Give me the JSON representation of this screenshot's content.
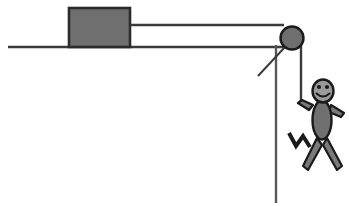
{
  "figure": {
    "canvas": {
      "width": 349,
      "height": 206,
      "background": "#ffffff"
    }
  },
  "colors": {
    "stroke_dark": "#1a1a1a",
    "fill_gray": "#6f6f6f",
    "body_gray": "#707070",
    "head_gray": "#9a9a9a",
    "limb_gray": "#7a7a7a",
    "surface_gray": "#3a3a3a",
    "background": "#ffffff"
  },
  "objects": {
    "surface": {
      "name": "horizontal surface",
      "x1": 8,
      "y1": 47,
      "x2": 283,
      "y2": 47,
      "stroke_width": 2.6
    },
    "block": {
      "name": "block",
      "x": 69,
      "y": 8,
      "width": 61,
      "height": 39,
      "fill": "#6f6f6f",
      "stroke": "#2b2b2b",
      "stroke_width": 2.6
    },
    "rope_horizontal": {
      "name": "rope from block to pulley",
      "x1": 130,
      "y1": 25,
      "x2": 284,
      "y2": 25,
      "stroke_width": 2.4
    },
    "pulley": {
      "name": "pulley wheel",
      "cx": 292,
      "cy": 38,
      "r": 11.5,
      "fill": "#6f6f6f",
      "stroke": "#1a1a1a",
      "stroke_width": 2.4
    },
    "pulley_support": {
      "name": "pulley support bracket",
      "x1": 285,
      "y1": 47,
      "x2": 258,
      "y2": 76,
      "stroke_width": 2.0
    },
    "rope_vertical_long": {
      "name": "long vertical rope segment",
      "x1": 276,
      "y1": 45,
      "x2": 276,
      "y2": 203,
      "stroke_width": 2.4
    },
    "rope_vertical_short": {
      "name": "rope held by person",
      "x1": 301,
      "y1": 45,
      "x2": 301,
      "y2": 104,
      "stroke_width": 2.4
    }
  },
  "person": {
    "name": "stick figure person",
    "head": {
      "cx": 323,
      "cy": 91,
      "rx": 10.5,
      "ry": 11.5
    },
    "face": {
      "left_eye": {
        "cx": 319,
        "cy": 87,
        "r": 2.1
      },
      "right_eye": {
        "cx": 327,
        "cy": 87,
        "r": 2.1
      },
      "smile": "M 316.5 93.5 Q 323 99.5 329.5 93.5"
    },
    "torso": {
      "cx": 322,
      "cy": 120,
      "rx": 9.5,
      "ry": 19.5
    },
    "arm_left": {
      "points": "313,105 302,100 298,103 309,110",
      "label": "raised left arm holding rope"
    },
    "arm_right": {
      "points": "331,105 344,113 341,117 329,112",
      "label": "right arm"
    },
    "leg_left": {
      "points": "317,138 303,166 308,170 322,145",
      "label": "left leg"
    },
    "leg_right": {
      "points": "327,138 342,166 337,170 323,145",
      "label": "right leg"
    },
    "zigzag": {
      "path": "M 289 133 L 296 146 L 303 136 L 310 147",
      "label": "motion squiggle near legs",
      "stroke_width": 4.0
    }
  }
}
